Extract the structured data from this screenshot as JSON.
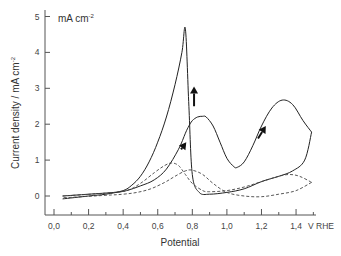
{
  "chart_data": {
    "type": "line",
    "title": "",
    "xlabel": "Potential",
    "xunit": "V RHE",
    "ylabel": "Current density / mA cm-2",
    "yunit_annotation": "mA cm-2",
    "xlim": [
      -0.05,
      1.5
    ],
    "ylim": [
      -0.5,
      5.1
    ],
    "xticks": [
      0.0,
      0.2,
      0.4,
      0.6,
      0.8,
      1.0,
      1.2,
      1.4
    ],
    "xtick_labels": [
      "0,0",
      "0,2",
      "0,4",
      "0,6",
      "0,8",
      "1,0",
      "1,2",
      "1,4"
    ],
    "yticks": [
      0,
      1,
      2,
      3,
      4,
      5
    ],
    "ytick_labels": [
      "0",
      "1",
      "2",
      "3",
      "4",
      "5"
    ],
    "grid": false,
    "legend": null,
    "series": [
      {
        "name": "solid CV",
        "style": "solid",
        "segments": [
          {
            "direction": "forward scan",
            "x": [
              0.05,
              0.2,
              0.35,
              0.42,
              0.5,
              0.58,
              0.65,
              0.72,
              0.76,
              0.78,
              0.8,
              0.83,
              0.86,
              0.88,
              0.92,
              0.96,
              1.0,
              1.04,
              1.06,
              1.1,
              1.15,
              1.2,
              1.26,
              1.32,
              1.38,
              1.44,
              1.49
            ],
            "y": [
              0.0,
              0.05,
              0.1,
              0.15,
              0.28,
              0.45,
              0.75,
              1.3,
              1.75,
              1.95,
              2.1,
              2.2,
              2.22,
              2.2,
              1.95,
              1.5,
              1.05,
              0.82,
              0.8,
              0.95,
              1.4,
              1.95,
              2.45,
              2.67,
              2.55,
              2.1,
              1.78
            ]
          },
          {
            "direction": "reverse scan",
            "x": [
              1.49,
              1.45,
              1.38,
              1.3,
              1.2,
              1.1,
              1.0,
              0.9,
              0.84,
              0.8,
              0.78,
              0.76,
              0.74,
              0.7,
              0.65,
              0.6,
              0.55,
              0.5,
              0.45,
              0.4,
              0.3,
              0.2,
              0.05
            ],
            "y": [
              1.78,
              1.0,
              0.7,
              0.55,
              0.4,
              0.2,
              0.1,
              0.05,
              0.1,
              0.6,
              2.5,
              4.65,
              4.0,
              3.1,
              2.2,
              1.5,
              0.95,
              0.55,
              0.3,
              0.15,
              0.05,
              0.0,
              -0.08
            ]
          }
        ]
      },
      {
        "name": "dashed CV",
        "style": "dashed",
        "segments": [
          {
            "direction": "forward scan",
            "x": [
              0.05,
              0.3,
              0.42,
              0.5,
              0.58,
              0.64,
              0.68,
              0.72,
              0.76,
              0.8,
              0.86,
              0.9,
              1.0,
              1.1,
              1.2,
              1.3,
              1.36,
              1.42,
              1.49
            ],
            "y": [
              0.0,
              0.08,
              0.15,
              0.35,
              0.65,
              0.85,
              0.92,
              0.85,
              0.6,
              0.35,
              0.15,
              0.12,
              0.15,
              0.25,
              0.4,
              0.55,
              0.6,
              0.55,
              0.38
            ]
          },
          {
            "direction": "reverse scan",
            "x": [
              1.49,
              1.4,
              1.3,
              1.2,
              1.1,
              1.0,
              0.92,
              0.86,
              0.8,
              0.76,
              0.7,
              0.64,
              0.56,
              0.48,
              0.4,
              0.3,
              0.05
            ],
            "y": [
              0.38,
              0.15,
              0.05,
              -0.02,
              0.0,
              0.1,
              0.35,
              0.6,
              0.72,
              0.7,
              0.55,
              0.38,
              0.2,
              0.1,
              0.05,
              0.02,
              -0.05
            ]
          }
        ]
      }
    ],
    "annotations": [
      {
        "type": "arrow",
        "from": [
          0.81,
          2.5
        ],
        "to": [
          0.81,
          3.05
        ],
        "label": ""
      },
      {
        "type": "arrow",
        "from": [
          0.735,
          1.3
        ],
        "to": [
          0.765,
          1.5
        ],
        "label": ""
      },
      {
        "type": "arrow",
        "from": [
          1.18,
          1.6
        ],
        "to": [
          1.225,
          1.95
        ],
        "label": ""
      }
    ]
  },
  "labels": {
    "unit_annotation": "mA cm",
    "unit_exp": "-2",
    "ylabel_main": "Current density / mA cm",
    "ylabel_exp": "-2",
    "xlabel": "Potential",
    "xunit": "V RHE"
  }
}
